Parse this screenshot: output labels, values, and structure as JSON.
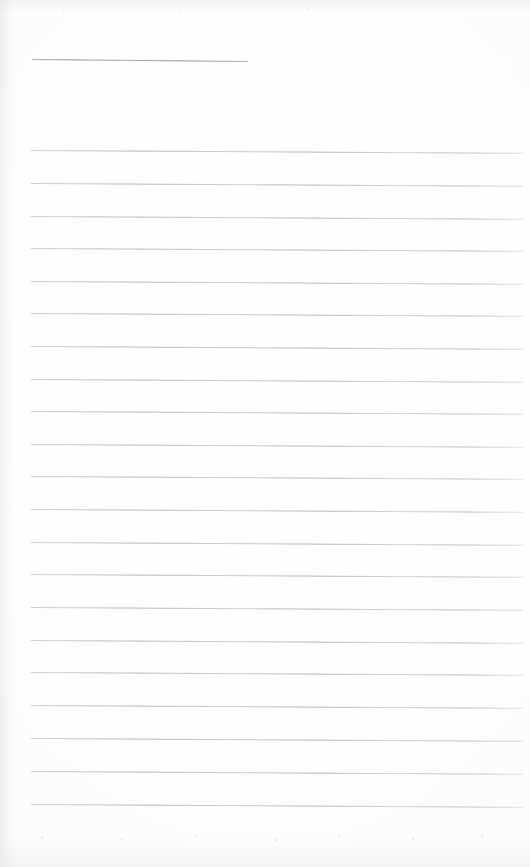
{
  "document": {
    "kind": "scanned-blank-ruled-page",
    "page_width": 530,
    "page_height": 867,
    "paper_color": "#fdfdfd",
    "rule_color": "#b4b4bc",
    "heading_rule_color": "#8e8e9a",
    "visible_text": "",
    "note": "Blank ruled notebook page scan with no written content"
  },
  "ruling": {
    "left_margin_x": 32,
    "right_edge_x": 522,
    "line_spacing_px": 32.5,
    "skew_degrees": 0.32,
    "full_line_count": 21,
    "heading_line_count": 1,
    "lines": [
      {
        "id": "heading-rule",
        "y": 59,
        "x": 32,
        "width": 216,
        "role": "heading",
        "skew": 0.55
      },
      {
        "id": "rule-01",
        "y": 150,
        "x": 31,
        "width": 492,
        "role": "body",
        "skew": 0.32
      },
      {
        "id": "rule-02",
        "y": 183,
        "x": 31,
        "width": 492,
        "role": "body",
        "skew": 0.32
      },
      {
        "id": "rule-03",
        "y": 216,
        "x": 31,
        "width": 492,
        "role": "body",
        "skew": 0.32
      },
      {
        "id": "rule-04",
        "y": 248,
        "x": 31,
        "width": 492,
        "role": "body",
        "skew": 0.32
      },
      {
        "id": "rule-05",
        "y": 281,
        "x": 31,
        "width": 492,
        "role": "body",
        "skew": 0.32
      },
      {
        "id": "rule-06",
        "y": 313,
        "x": 31,
        "width": 492,
        "role": "body",
        "skew": 0.32
      },
      {
        "id": "rule-07",
        "y": 346,
        "x": 31,
        "width": 492,
        "role": "body",
        "skew": 0.32
      },
      {
        "id": "rule-08",
        "y": 379,
        "x": 31,
        "width": 492,
        "role": "body",
        "skew": 0.32
      },
      {
        "id": "rule-09",
        "y": 411,
        "x": 31,
        "width": 492,
        "role": "body",
        "skew": 0.32
      },
      {
        "id": "rule-10",
        "y": 444,
        "x": 31,
        "width": 492,
        "role": "body",
        "skew": 0.32
      },
      {
        "id": "rule-11",
        "y": 476,
        "x": 31,
        "width": 492,
        "role": "body",
        "skew": 0.32
      },
      {
        "id": "rule-12",
        "y": 509,
        "x": 31,
        "width": 492,
        "role": "body",
        "skew": 0.32
      },
      {
        "id": "rule-13",
        "y": 542,
        "x": 31,
        "width": 492,
        "role": "body",
        "skew": 0.32
      },
      {
        "id": "rule-14",
        "y": 574,
        "x": 31,
        "width": 492,
        "role": "body",
        "skew": 0.32
      },
      {
        "id": "rule-15",
        "y": 607,
        "x": 31,
        "width": 492,
        "role": "body",
        "skew": 0.32
      },
      {
        "id": "rule-16",
        "y": 640,
        "x": 31,
        "width": 492,
        "role": "body",
        "skew": 0.32
      },
      {
        "id": "rule-17",
        "y": 672,
        "x": 31,
        "width": 492,
        "role": "body",
        "skew": 0.32
      },
      {
        "id": "rule-18",
        "y": 705,
        "x": 31,
        "width": 492,
        "role": "body",
        "skew": 0.32
      },
      {
        "id": "rule-19",
        "y": 738,
        "x": 31,
        "width": 492,
        "role": "body",
        "skew": 0.32
      },
      {
        "id": "rule-20",
        "y": 771,
        "x": 31,
        "width": 492,
        "role": "body",
        "skew": 0.32
      },
      {
        "id": "rule-21",
        "y": 804,
        "x": 31,
        "width": 492,
        "role": "body",
        "skew": 0.32
      }
    ]
  }
}
